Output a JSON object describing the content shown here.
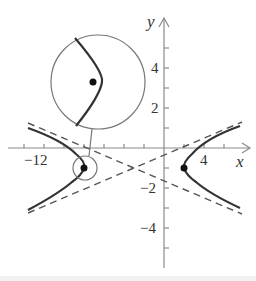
{
  "figure": {
    "type": "hyperbola-graph",
    "axes": {
      "x_label": "x",
      "y_label": "y",
      "x_tick_labels": [
        {
          "value": -12,
          "text": "−12"
        },
        {
          "value": 4,
          "text": "4"
        }
      ],
      "y_tick_labels": [
        {
          "value": 4,
          "text": "4"
        },
        {
          "value": 2,
          "text": "2"
        },
        {
          "value": -2,
          "text": "−2"
        },
        {
          "value": -4,
          "text": "−4"
        }
      ],
      "x_tick_step": 2,
      "y_tick_step": 1
    },
    "hyperbola": {
      "center": [
        -3,
        -1
      ],
      "vertices": [
        [
          -8,
          -1
        ],
        [
          2,
          -1
        ]
      ],
      "asymptote_style": "dashed"
    },
    "magnifier": {
      "description": "enlarged view of left vertex",
      "target_point": [
        -8,
        -1
      ]
    },
    "colors": {
      "curve": "#333333",
      "axis": "#888888",
      "asymptote": "#555555",
      "circle": "#777777"
    }
  }
}
